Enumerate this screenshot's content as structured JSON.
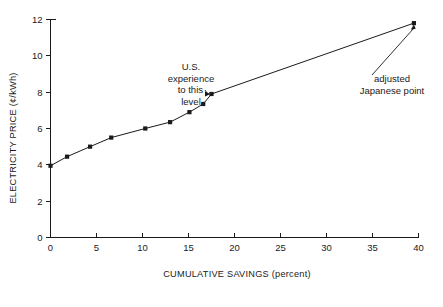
{
  "chart_data": {
    "type": "line",
    "title": "",
    "xlabel": "CUMULATIVE SAVINGS (percent)",
    "ylabel": "ELECTRICITY PRICE (¢/kWh)",
    "xlim": [
      0,
      40
    ],
    "ylim": [
      0,
      12
    ],
    "grid": false,
    "legend": "none",
    "xticks": [
      0,
      5,
      10,
      15,
      20,
      25,
      30,
      35,
      40
    ],
    "xtick_labels": [
      "0",
      "5",
      "10",
      "15",
      "20",
      "25",
      "30",
      "35",
      "40"
    ],
    "yticks": [
      0,
      2,
      4,
      6,
      8,
      10,
      12
    ],
    "ytick_labels": [
      "0",
      "2",
      "4",
      "6",
      "8",
      "10",
      "12"
    ],
    "series": [
      {
        "name": "electricity price vs cumulative savings",
        "marker": "square",
        "x": [
          0.0,
          1.8,
          4.3,
          6.6,
          10.3,
          13.0,
          15.1,
          16.6,
          17.5,
          39.5
        ],
        "y": [
          3.95,
          4.45,
          5.0,
          5.5,
          6.0,
          6.35,
          6.9,
          7.35,
          7.9,
          11.8
        ]
      }
    ],
    "annotations": [
      {
        "name": "us-experience-annotation",
        "lines": [
          "U.S.",
          "experience",
          "to this",
          "level"
        ],
        "target_x": 17.5,
        "target_y": 7.9
      },
      {
        "name": "adjusted-japanese-point-annotation",
        "lines": [
          "adjusted",
          "Japanese point"
        ],
        "target_x": 39.5,
        "target_y": 11.8
      }
    ]
  },
  "axes": {
    "y_title": "ELECTRICITY PRICE (¢/kWh)",
    "x_title": "CUMULATIVE SAVINGS (percent)"
  },
  "colors": {
    "ink": "#1a1a1a",
    "background": "#ffffff"
  }
}
